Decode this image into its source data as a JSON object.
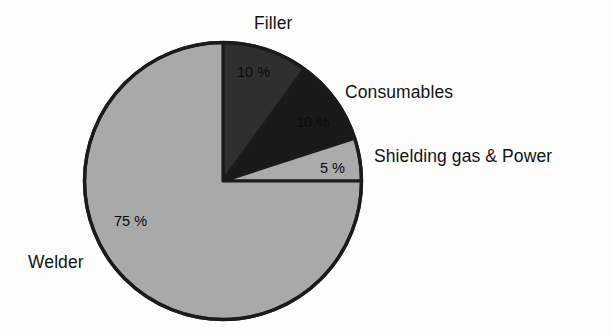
{
  "chart_data": {
    "type": "pie",
    "title": "",
    "subtitle": "",
    "xlabel": "",
    "ylabel": "",
    "grid": false,
    "legend_position": "callout-labels",
    "start_angle_deg": 0,
    "direction": "clockwise",
    "categories": [
      "Filler",
      "Consumables",
      "Shielding gas & Power",
      "Welder"
    ],
    "values": [
      10,
      10,
      5,
      75
    ],
    "value_labels": [
      "10 %",
      "10 %",
      "5 %",
      "75 %"
    ],
    "colors": [
      "#2f2f2f",
      "#191919",
      "#ababab",
      "#a9a9a9"
    ],
    "outline_color": "#1b1b1b",
    "slices": [
      {
        "name": "Filler",
        "value": 10,
        "value_label": "10 %",
        "color": "#2f2f2f",
        "angle_deg": 36
      },
      {
        "name": "Consumables",
        "value": 10,
        "value_label": "10 %",
        "color": "#191919",
        "angle_deg": 36
      },
      {
        "name": "Shielding gas & Power",
        "value": 5,
        "value_label": "5 %",
        "color": "#ababab",
        "angle_deg": 18
      },
      {
        "name": "Welder",
        "value": 75,
        "value_label": "75 %",
        "color": "#a9a9a9",
        "angle_deg": 270
      }
    ]
  },
  "labels": {
    "filler": "Filler",
    "consumables": "Consumables",
    "shielding": "Shielding gas & Power",
    "welder": "Welder"
  },
  "values": {
    "filler": "10 %",
    "consumables": "10 %",
    "shielding": "5 %",
    "welder": "75 %"
  }
}
